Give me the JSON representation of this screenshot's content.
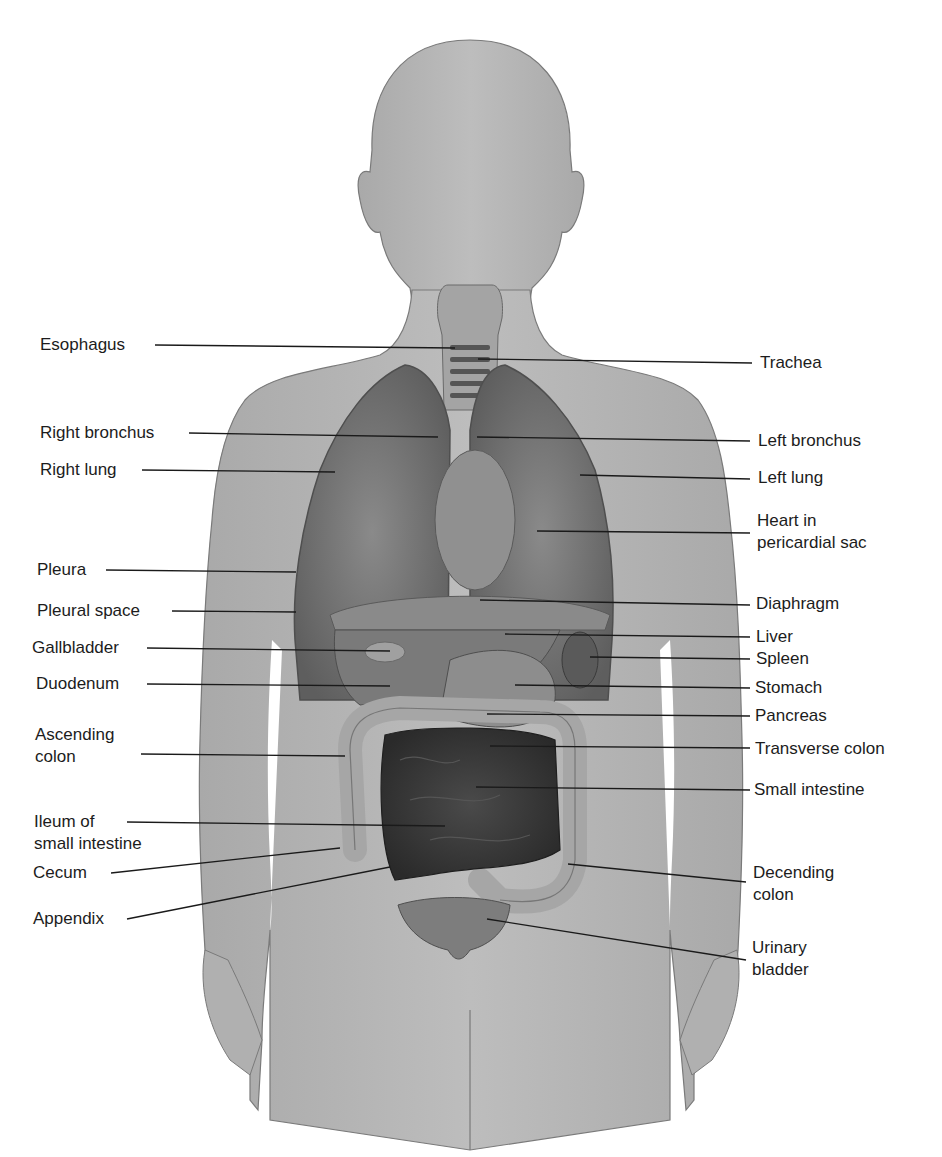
{
  "figure": {
    "colors": {
      "background": "#ffffff",
      "body_silhouette": "#b8b8b8",
      "body_outline": "#7a7a7a",
      "lung": "#6e6e6e",
      "small_intestine": "#3c3c3c",
      "colon": "#a9a9a9",
      "leader_line": "#1a1a1a",
      "label_text": "#1c1c1c"
    }
  },
  "labels_left": [
    {
      "id": "esophagus",
      "text": "Esophagus"
    },
    {
      "id": "right-bronchus",
      "text": "Right bronchus"
    },
    {
      "id": "right-lung",
      "text": "Right lung"
    },
    {
      "id": "pleura",
      "text": "Pleura"
    },
    {
      "id": "pleural-space",
      "text": "Pleural space"
    },
    {
      "id": "gallbladder",
      "text": "Gallbladder"
    },
    {
      "id": "duodenum",
      "text": "Duodenum"
    },
    {
      "id": "ascending-colon",
      "text": "Ascending\ncolon"
    },
    {
      "id": "ileum",
      "text": "Ileum of\nsmall intestine"
    },
    {
      "id": "cecum",
      "text": "Cecum"
    },
    {
      "id": "appendix",
      "text": "Appendix"
    }
  ],
  "labels_right": [
    {
      "id": "trachea",
      "text": "Trachea"
    },
    {
      "id": "left-bronchus",
      "text": "Left bronchus"
    },
    {
      "id": "left-lung",
      "text": "Left lung"
    },
    {
      "id": "heart",
      "text": "Heart in\npericardial sac"
    },
    {
      "id": "diaphragm",
      "text": "Diaphragm"
    },
    {
      "id": "liver",
      "text": "Liver"
    },
    {
      "id": "spleen",
      "text": "Spleen"
    },
    {
      "id": "stomach",
      "text": "Stomach"
    },
    {
      "id": "pancreas",
      "text": "Pancreas"
    },
    {
      "id": "transverse-colon",
      "text": "Transverse colon"
    },
    {
      "id": "small-intestine",
      "text": "Small intestine"
    },
    {
      "id": "descending-colon",
      "text": "Decending\ncolon"
    },
    {
      "id": "urinary-bladder",
      "text": "Urinary\nbladder"
    }
  ]
}
